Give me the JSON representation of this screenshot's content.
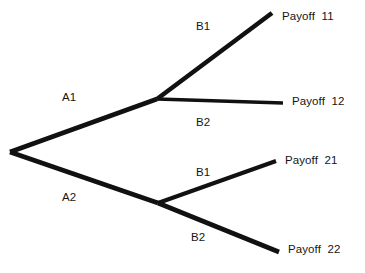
{
  "diagram": {
    "type": "game-tree",
    "title": "",
    "background_color": "#ffffff",
    "line_color": "#111111",
    "text_color": "#151515",
    "nodes": [
      {
        "id": "root",
        "label": "",
        "x": 10,
        "y": 152
      },
      {
        "id": "node-a1",
        "label": "",
        "x": 157,
        "y": 99
      },
      {
        "id": "node-a2",
        "label": "",
        "x": 158,
        "y": 203
      }
    ],
    "edges": [
      {
        "id": "edge-a1",
        "label": "A1",
        "from": "root",
        "to": "node-a1",
        "x1": 10,
        "y1": 152,
        "x2": 157,
        "y2": 99,
        "width": 4.6
      },
      {
        "id": "edge-a2",
        "label": "A2",
        "from": "root",
        "to": "node-a2",
        "x1": 10,
        "y1": 152,
        "x2": 158,
        "y2": 203,
        "width": 4.6
      },
      {
        "id": "edge-b1-upper",
        "label": "B1",
        "from": "node-a1",
        "to": "payoff-11",
        "x1": 157,
        "y1": 99,
        "x2": 272,
        "y2": 13,
        "width": 4.6
      },
      {
        "id": "edge-b2-upper",
        "label": "B2",
        "from": "node-a1",
        "to": "payoff-12",
        "x1": 157,
        "y1": 99,
        "x2": 283,
        "y2": 103,
        "width": 3.4
      },
      {
        "id": "edge-b1-lower",
        "label": "B1",
        "from": "node-a2",
        "to": "payoff-21",
        "x1": 158,
        "y1": 203,
        "x2": 276,
        "y2": 161,
        "width": 4.0
      },
      {
        "id": "edge-b2-lower",
        "label": "B2",
        "from": "node-a2",
        "to": "payoff-22",
        "x1": 158,
        "y1": 203,
        "x2": 279,
        "y2": 252,
        "width": 4.6
      }
    ],
    "branch_labels": [
      {
        "id": "label-a1",
        "text": "A1",
        "x": 62,
        "y": 92
      },
      {
        "id": "label-a2",
        "text": "A2",
        "x": 62,
        "y": 192
      },
      {
        "id": "label-b1-upper",
        "text": "B1",
        "x": 196,
        "y": 21
      },
      {
        "id": "label-b2-upper",
        "text": "B2",
        "x": 196,
        "y": 117
      },
      {
        "id": "label-b1-lower",
        "text": "B1",
        "x": 196,
        "y": 167
      },
      {
        "id": "label-b2-lower",
        "text": "B2",
        "x": 191,
        "y": 232
      }
    ],
    "payoffs": [
      {
        "id": "payoff-11",
        "text": "Payoff  11",
        "x": 282,
        "y": 11
      },
      {
        "id": "payoff-12",
        "text": "Payoff  12",
        "x": 292,
        "y": 96
      },
      {
        "id": "payoff-21",
        "text": "Payoff  21",
        "x": 285,
        "y": 155
      },
      {
        "id": "payoff-22",
        "text": "Payoff  22",
        "x": 288,
        "y": 244
      }
    ]
  }
}
